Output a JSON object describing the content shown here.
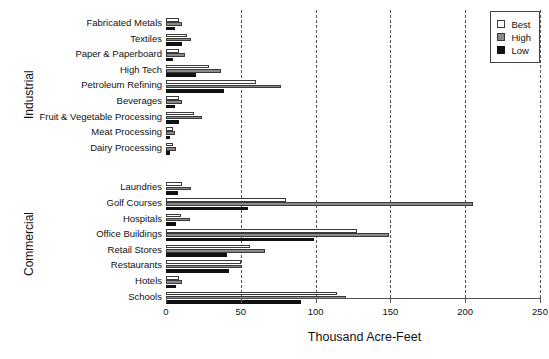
{
  "chart_data": {
    "type": "bar",
    "orientation": "horizontal",
    "title": "",
    "xlabel": "Thousand Acre-Feet",
    "ylabel": "",
    "xlim": [
      0,
      250
    ],
    "xticks": [
      0,
      50,
      100,
      150,
      200,
      250
    ],
    "grid": "vertical dashed at 50,100,150,200,250",
    "legend": {
      "position": "top-right",
      "entries": [
        {
          "label": "Best",
          "color": "#ffffff",
          "name": "best"
        },
        {
          "label": "High",
          "color": "#8a8a8a",
          "name": "high"
        },
        {
          "label": "Low",
          "color": "#111111",
          "name": "low"
        }
      ]
    },
    "panels": [
      {
        "name": "Industrial",
        "categories": [
          "Fabricated Metals",
          "Textiles",
          "Paper & Paperboard",
          "High Tech",
          "Petroleum Refining",
          "Beverages",
          "Fruit & Vegetable Processing",
          "Meat Processing",
          "Dairy Processing"
        ],
        "series": [
          {
            "name": "Best",
            "values": [
              9,
              14,
              9,
              29,
              60,
              9,
              19,
              5,
              5
            ]
          },
          {
            "name": "High",
            "values": [
              11,
              17,
              13,
              37,
              77,
              11,
              24,
              6,
              7
            ]
          },
          {
            "name": "Low",
            "values": [
              6,
              11,
              5,
              20,
              39,
              6,
              9,
              3,
              3
            ]
          }
        ]
      },
      {
        "name": "Commercial",
        "categories": [
          "Laundries",
          "Golf Courses",
          "Hospitals",
          "Office Buildings",
          "Retail Stores",
          "Restaurants",
          "Hotels",
          "Schools"
        ],
        "series": [
          {
            "name": "Best",
            "values": [
              11,
              80,
              10,
              128,
              56,
              50,
              9,
              114
            ]
          },
          {
            "name": "High",
            "values": [
              17,
              205,
              16,
              149,
              66,
              51,
              11,
              120
            ]
          },
          {
            "name": "Low",
            "values": [
              8,
              55,
              7,
              99,
              41,
              42,
              7,
              90
            ]
          }
        ]
      }
    ]
  }
}
